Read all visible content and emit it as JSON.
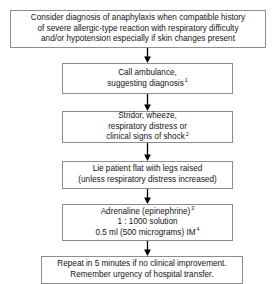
{
  "diagram": {
    "type": "flowchart",
    "orientation": "top-to-bottom",
    "border_color": "#8d8d8d",
    "background_color": "#ffffff",
    "text_color": "#141414",
    "arrow_color": "#000000"
  },
  "nodes": [
    {
      "id": "consider-diagnosis",
      "lines": [
        "Consider diagnosis of anaphylaxis when compatible history",
        "of severe allergic-type reaction with respiratory difficulty",
        "and/or hypotension especially if skin changes present"
      ]
    },
    {
      "id": "call-ambulance",
      "lines": [
        "Call ambulance,",
        "suggesting diagnosis"
      ],
      "superscript": "1"
    },
    {
      "id": "signs-symptoms",
      "lines": [
        "Stridor, wheeze,",
        "respiratory distress or",
        "clinical signs of shock"
      ],
      "superscript": "2"
    },
    {
      "id": "lie-patient-flat",
      "lines": [
        "Lie patient flat with legs raised",
        "(unless respiratory distress increased)"
      ]
    },
    {
      "id": "adrenaline",
      "line1_a": "Adrenaline (epinephrine)",
      "line1_sup": "3",
      "line2_bold": "1 : 1000",
      "line2_rest": " solution",
      "line3_a": "0.5 ml (500 micrograms) IM",
      "line3_sup": "4"
    },
    {
      "id": "repeat",
      "lines": [
        "Repeat in 5 minutes if no clinical improvement.",
        "Remember urgency of hospital transfer."
      ]
    }
  ]
}
